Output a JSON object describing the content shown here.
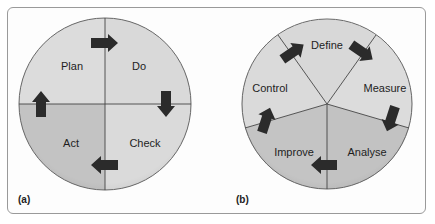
{
  "figure": {
    "panels": [
      {
        "label": "(a)",
        "title": "PDCA cycle",
        "segments": [
          {
            "label": "Plan",
            "shade": "light"
          },
          {
            "label": "Do",
            "shade": "light"
          },
          {
            "label": "Check",
            "shade": "light"
          },
          {
            "label": "Act",
            "shade": "dark"
          }
        ]
      },
      {
        "label": "(b)",
        "title": "DMAIC cycle",
        "segments": [
          {
            "label": "Define",
            "shade": "light"
          },
          {
            "label": "Measure",
            "shade": "light"
          },
          {
            "label": "Analyse",
            "shade": "dark"
          },
          {
            "label": "Improve",
            "shade": "dark"
          },
          {
            "label": "Control",
            "shade": "light"
          }
        ]
      }
    ],
    "colors": {
      "light_segment": "#dadada",
      "dark_segment": "#c2c2c2",
      "arrow": "#2b2b2b",
      "outline": "#555555"
    }
  }
}
